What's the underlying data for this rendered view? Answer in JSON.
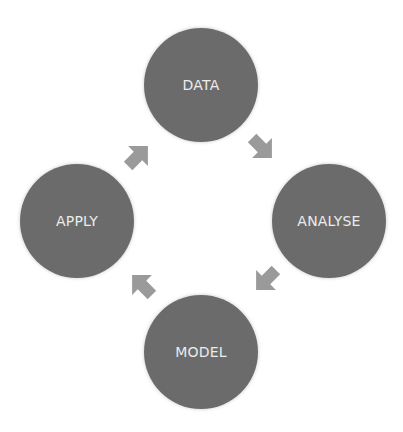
{
  "diagram": {
    "type": "cycle",
    "direction": "clockwise",
    "colors": {
      "node_fill": "#6b6b6b",
      "node_text": "#ececec",
      "arrow_fill": "#9a9a9a",
      "background": "#ffffff"
    },
    "nodes": [
      {
        "id": "data",
        "label": "DATA",
        "position": "top"
      },
      {
        "id": "analyse",
        "label": "ANALYSE",
        "position": "right"
      },
      {
        "id": "model",
        "label": "MODEL",
        "position": "bottom"
      },
      {
        "id": "apply",
        "label": "APPLY",
        "position": "left"
      }
    ],
    "edges": [
      {
        "from": "DATA",
        "to": "ANALYSE",
        "icon": "arrow-down-right-icon"
      },
      {
        "from": "ANALYSE",
        "to": "MODEL",
        "icon": "arrow-down-left-icon"
      },
      {
        "from": "MODEL",
        "to": "APPLY",
        "icon": "arrow-up-left-icon"
      },
      {
        "from": "APPLY",
        "to": "DATA",
        "icon": "arrow-up-right-icon"
      }
    ]
  }
}
